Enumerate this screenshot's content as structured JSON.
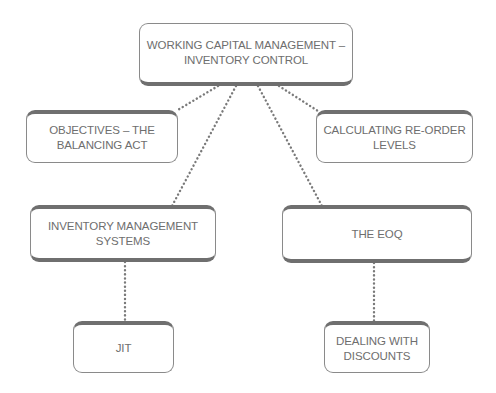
{
  "diagram": {
    "root": {
      "label": "WORKING CAPITAL MANAGEMENT –\nINVENTORY CONTROL"
    },
    "nodes": [
      {
        "id": "objectives",
        "label": "OBJECTIVES – THE\nBALANCING ACT"
      },
      {
        "id": "reorder",
        "label": "CALCULATING RE-ORDER\nLEVELS"
      },
      {
        "id": "ims",
        "label": "INVENTORY MANAGEMENT\nSYSTEMS"
      },
      {
        "id": "eoq",
        "label": "THE EOQ"
      },
      {
        "id": "jit",
        "label": "JIT"
      },
      {
        "id": "discounts",
        "label": "DEALING WITH\nDISCOUNTS"
      }
    ],
    "edges": [
      {
        "from": "root",
        "to": "objectives",
        "style": "dotted"
      },
      {
        "from": "root",
        "to": "reorder",
        "style": "dotted"
      },
      {
        "from": "root",
        "to": "ims",
        "style": "dotted"
      },
      {
        "from": "root",
        "to": "eoq",
        "style": "dotted"
      },
      {
        "from": "ims",
        "to": "jit",
        "style": "dotted"
      },
      {
        "from": "eoq",
        "to": "discounts",
        "style": "dotted"
      }
    ],
    "colors": {
      "border": "#8a8a8a",
      "thick_border": "#6f6f6f",
      "text": "#6e6e6e",
      "connector": "#7a7a7a"
    }
  }
}
